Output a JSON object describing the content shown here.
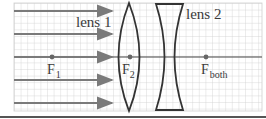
{
  "diagram": {
    "type": "optics-ray-diagram",
    "labels": {
      "lens1": "lens 1",
      "lens2": "lens 2",
      "f1_main": "F",
      "f1_sub": "1",
      "f2_main": "F",
      "f2_sub": "2",
      "fboth_main": "F",
      "fboth_sub": "both"
    },
    "elements": {
      "incoming_rays": 5,
      "lens1_type": "converging (biconvex)",
      "lens2_type": "diverging (biconcave)",
      "focal_points": [
        "F1",
        "F2",
        "Fboth"
      ]
    },
    "colors": {
      "grid": "#cfcfcf",
      "ray": "#7a7a7a",
      "lens": "#333333",
      "axis": "#444444",
      "text": "#3a3a3a",
      "rule": "#555555"
    }
  }
}
